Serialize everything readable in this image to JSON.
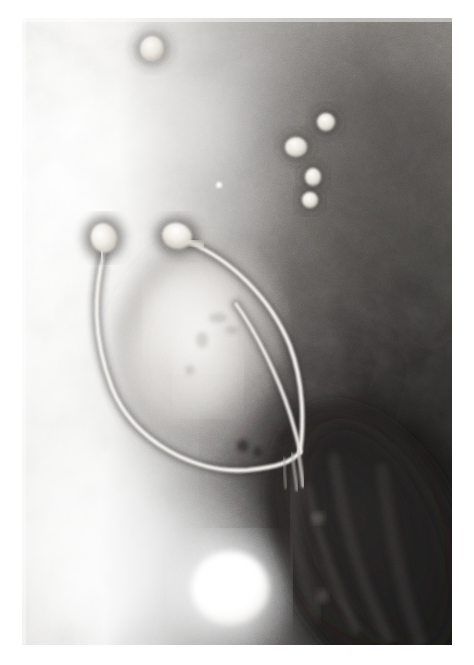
{
  "page": {
    "kind": "electron-micrograph",
    "width": 474,
    "height": 665,
    "background_color": "#ffffff",
    "caption": ""
  },
  "micrograph": {
    "label": "transmission-electron-micrograph",
    "frame": {
      "x": 22,
      "y": 18,
      "width": 430,
      "height": 627
    },
    "modality": "negative-stain TEM",
    "palette": {
      "paper_white": "#ffffff",
      "highlight": "#f4f2ee",
      "light_gray": "#d8d6d1",
      "mid_gray": "#9c9a95",
      "dark_gray": "#5c5a57",
      "deep_shadow": "#231f1f",
      "near_black": "#100e0e",
      "filament_bright": "#f7f5f0",
      "capsid_bright": "#f2efe8"
    },
    "tone": {
      "upper_left_value": "bright",
      "upper_right_value": "dark",
      "lower_left_value": "very bright",
      "lower_right_value": "near black"
    }
  },
  "specimen": {
    "bacterium": {
      "name": "bacterial-cell",
      "description": "large dark elongated cell, lower right, oriented diagonally",
      "center": {
        "x": 372,
        "y": 545
      },
      "rx": 92,
      "ry": 150,
      "rotation_deg": -24,
      "fill": "#262323"
    },
    "halo_cell": {
      "name": "light-oval-body",
      "description": "pale oval body at center enclosed by phage tails",
      "center": {
        "x": 196,
        "y": 345
      },
      "rx": 84,
      "ry": 108,
      "rotation_deg": 12,
      "fill": "#d9d6d0"
    },
    "attachment_point": {
      "x": 300,
      "y": 452
    },
    "phages": [
      {
        "id": "phage-1",
        "name": "phage-left",
        "head": {
          "cx": 104,
          "cy": 238,
          "rx": 13,
          "ry": 15,
          "rotation_deg": -18
        },
        "tail_path": "M104,252 C94,290 92,330 112,382 C134,436 196,466 248,462 C278,459 292,456 300,452",
        "tail_width": 4.2,
        "length_note": "long flexible tail curving left and around the oval body"
      },
      {
        "id": "phage-2",
        "name": "phage-upper-middle",
        "head": {
          "cx": 177,
          "cy": 236,
          "rx": 15,
          "ry": 13,
          "rotation_deg": 18
        },
        "tail_path": "M190,243 C228,258 270,296 290,346 C304,384 304,424 300,452",
        "tail_width": 4.0,
        "length_note": "long flexible tail arcing right then down to attachment"
      },
      {
        "id": "phage-3",
        "name": "phage-short-tail",
        "head": null,
        "tail_path": "M236,304 C256,332 278,376 290,414 C296,434 299,446 300,452",
        "tail_width": 3.6,
        "length_note": "partial tail, head out of field, inner of the three"
      }
    ],
    "free_particles": [
      {
        "id": "p-top",
        "name": "free-phage-head",
        "cx": 152,
        "cy": 49,
        "rx": 12,
        "ry": 13
      },
      {
        "id": "p-ur-1",
        "name": "free-phage-head",
        "cx": 326,
        "cy": 122,
        "rx": 9,
        "ry": 9
      },
      {
        "id": "p-ur-2",
        "name": "free-phage-head",
        "cx": 296,
        "cy": 147,
        "rx": 11,
        "ry": 10
      },
      {
        "id": "p-ur-3",
        "name": "free-phage-head",
        "cx": 313,
        "cy": 177,
        "rx": 8,
        "ry": 9
      },
      {
        "id": "p-ur-4",
        "name": "free-phage-head",
        "cx": 310,
        "cy": 200,
        "rx": 8,
        "ry": 8
      },
      {
        "id": "p-mid",
        "name": "stain-speck",
        "cx": 219,
        "cy": 185,
        "rx": 3,
        "ry": 3
      }
    ],
    "bright_blob": {
      "name": "bright-stain-artifact",
      "cx": 230,
      "cy": 588,
      "rx": 39,
      "ry": 37
    },
    "dark_specks": [
      {
        "cx": 243,
        "cy": 446,
        "r": 6
      },
      {
        "cx": 258,
        "cy": 452,
        "r": 5
      },
      {
        "cx": 283,
        "cy": 437,
        "r": 4
      }
    ]
  }
}
